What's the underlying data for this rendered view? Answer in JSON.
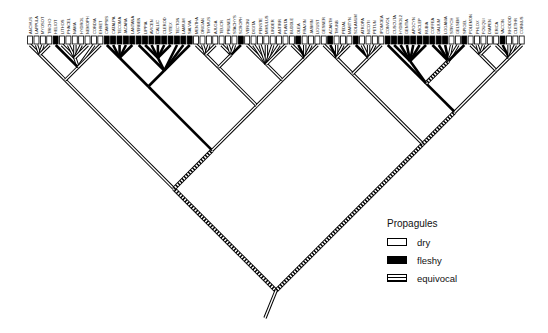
{
  "diagram": {
    "type": "cladogram",
    "character": "Propagule type",
    "tip_count": 78,
    "root": {
      "x": 265,
      "y": 318
    },
    "tip_row": {
      "x_start": 27,
      "x_end": 525,
      "y": 36,
      "box_height": 8
    },
    "tips": [
      {
        "label": "ANCHUS",
        "state": "dry"
      },
      {
        "label": "LAPPULA",
        "state": "dry"
      },
      {
        "label": "MYOSOT",
        "state": "dry"
      },
      {
        "label": "TRICHO",
        "state": "dry"
      },
      {
        "label": "HELIOT",
        "state": "fleshy"
      },
      {
        "label": "LITHOS",
        "state": "dry"
      },
      {
        "label": "PHACEL",
        "state": "dry"
      },
      {
        "label": "NAMA",
        "state": "dry"
      },
      {
        "label": "HYDROL",
        "state": "dry"
      },
      {
        "label": "NEMOPH",
        "state": "dry"
      },
      {
        "label": "CORDIA",
        "state": "dry"
      },
      {
        "label": "EHRET",
        "state": "dry"
      },
      {
        "label": "CAMPSIS",
        "state": "fleshy"
      },
      {
        "label": "CATALPA",
        "state": "fleshy"
      },
      {
        "label": "TECOMA",
        "state": "fleshy"
      },
      {
        "label": "JACARA",
        "state": "fleshy"
      },
      {
        "label": "LANTANA",
        "state": "fleshy"
      },
      {
        "label": "VERBEN",
        "state": "fleshy"
      },
      {
        "label": "LIPPIA",
        "state": "fleshy"
      },
      {
        "label": "AVICEN",
        "state": "fleshy"
      },
      {
        "label": "CALLIC",
        "state": "fleshy"
      },
      {
        "label": "CLEROD",
        "state": "fleshy"
      },
      {
        "label": "VITEX",
        "state": "fleshy"
      },
      {
        "label": "TECTON",
        "state": "fleshy"
      },
      {
        "label": "LAMIUM",
        "state": "fleshy"
      },
      {
        "label": "SALVIA",
        "state": "fleshy"
      },
      {
        "label": "MENTHA",
        "state": "dry"
      },
      {
        "label": "ORIGAN",
        "state": "dry"
      },
      {
        "label": "THYMUS",
        "state": "dry"
      },
      {
        "label": "AJUGA",
        "state": "dry"
      },
      {
        "label": "TEUCR",
        "state": "dry"
      },
      {
        "label": "PRUNEL",
        "state": "dry"
      },
      {
        "label": "STACHYS",
        "state": "dry"
      },
      {
        "label": "SCROPH",
        "state": "fleshy"
      },
      {
        "label": "VERONI",
        "state": "dry"
      },
      {
        "label": "DIGITA",
        "state": "dry"
      },
      {
        "label": "PENSTE",
        "state": "dry"
      },
      {
        "label": "MIMULUS",
        "state": "dry"
      },
      {
        "label": "LINDER",
        "state": "dry"
      },
      {
        "label": "ANTIRR",
        "state": "dry"
      },
      {
        "label": "PLANTA",
        "state": "dry"
      },
      {
        "label": "BUDDLE",
        "state": "dry"
      },
      {
        "label": "OLEA",
        "state": "fleshy"
      },
      {
        "label": "FRAXIN",
        "state": "dry"
      },
      {
        "label": "JASMIN",
        "state": "dry"
      },
      {
        "label": "LIGUST",
        "state": "dry"
      },
      {
        "label": "GESNER",
        "state": "dry"
      },
      {
        "label": "ACANTH",
        "state": "fleshy"
      },
      {
        "label": "THUNB",
        "state": "dry"
      },
      {
        "label": "PEDAL",
        "state": "dry"
      },
      {
        "label": "MARTYN",
        "state": "dry"
      },
      {
        "label": "SOLANUM",
        "state": "fleshy"
      },
      {
        "label": "ATROPA",
        "state": "dry"
      },
      {
        "label": "NICOTI",
        "state": "dry"
      },
      {
        "label": "PETUN",
        "state": "dry"
      },
      {
        "label": "IPOMOEA",
        "state": "dry"
      },
      {
        "label": "CONVOL",
        "state": "fleshy"
      },
      {
        "label": "CUSCUTA",
        "state": "fleshy"
      },
      {
        "label": "HYDROL2",
        "state": "fleshy"
      },
      {
        "label": "GENTIA",
        "state": "fleshy"
      },
      {
        "label": "APOCYN",
        "state": "fleshy"
      },
      {
        "label": "ASCLEP",
        "state": "fleshy"
      },
      {
        "label": "RUBIA",
        "state": "fleshy"
      },
      {
        "label": "COFFEA",
        "state": "fleshy"
      },
      {
        "label": "GALIUM",
        "state": "fleshy"
      },
      {
        "label": "LOGANIA",
        "state": "fleshy"
      },
      {
        "label": "STRYCH",
        "state": "dry"
      },
      {
        "label": "GELSEM",
        "state": "dry"
      },
      {
        "label": "SPIGEL",
        "state": "fleshy"
      },
      {
        "label": "POLEMON",
        "state": "dry"
      },
      {
        "label": "PHLOX",
        "state": "dry"
      },
      {
        "label": "FOUQUI",
        "state": "dry"
      },
      {
        "label": "DIAPEN",
        "state": "dry"
      },
      {
        "label": "ERICA",
        "state": "dry"
      },
      {
        "label": "VACCIN",
        "state": "fleshy"
      },
      {
        "label": "RHODOD",
        "state": "dry"
      },
      {
        "label": "CLETHR",
        "state": "dry"
      },
      {
        "label": "CORNUS",
        "state": "dry"
      }
    ]
  },
  "legend": {
    "title": "Propagules",
    "items": [
      {
        "key": "dry",
        "label": "dry"
      },
      {
        "key": "fleshy",
        "label": "fleshy"
      },
      {
        "key": "equivocal",
        "label": "equivocal"
      }
    ]
  },
  "colors": {
    "dry": "#ffffff",
    "fleshy": "#000000",
    "equivocal": "hatched",
    "line": "#000000"
  }
}
